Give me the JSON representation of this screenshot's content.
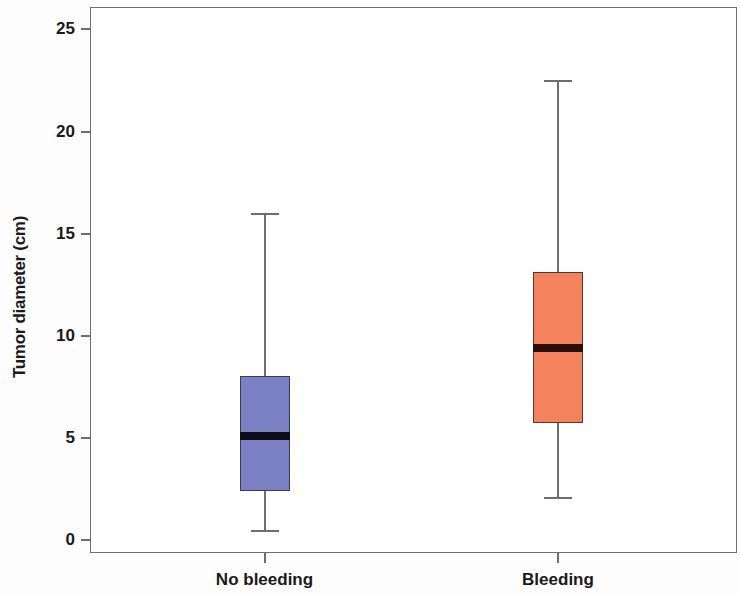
{
  "chart_data": {
    "type": "box",
    "title": "",
    "xlabel": "",
    "ylabel": "Tumor diameter (cm)",
    "ylim": [
      -0.65,
      26.1
    ],
    "yticks": [
      0,
      5,
      10,
      15,
      20,
      25
    ],
    "ytick_labels": [
      "0",
      "5",
      "10",
      "15",
      "20",
      "25"
    ],
    "grid": false,
    "legend": "none",
    "categories": [
      "No bleeding",
      "Bleeding"
    ],
    "boxes": [
      {
        "name": "No bleeding",
        "whisker_low": 0.5,
        "q1": 2.4,
        "median": 5.1,
        "q3": 8.0,
        "whisker_high": 16.0,
        "fill_color": "#7B7FC4",
        "edge_color": "#3a3a5c",
        "median_color": "#0d0d1a"
      },
      {
        "name": "Bleeding",
        "whisker_low": 2.1,
        "q1": 5.7,
        "median": 9.4,
        "q3": 13.1,
        "whisker_high": 22.5,
        "fill_color": "#F4825C",
        "edge_color": "#5a352a",
        "median_color": "#2b0f07"
      }
    ],
    "whisker_color": "#6e6e6e",
    "axis_color": "#6e6e6e",
    "background": "#ffffff"
  }
}
